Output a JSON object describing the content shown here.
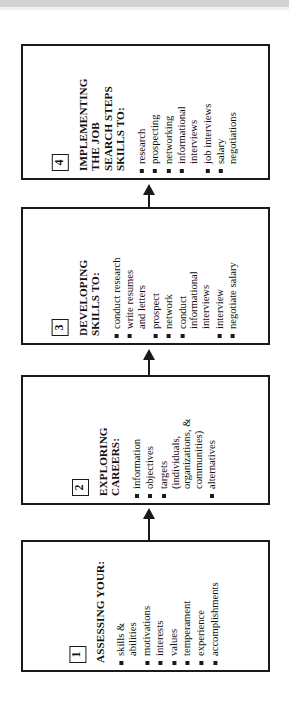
{
  "diagram": {
    "type": "flowchart",
    "orientation": "vertical-stack-rotated-90ccw",
    "flow_direction": "bottom-to-top",
    "accent_color": "#1a1a1a",
    "background_color": "#ffffff",
    "stages": [
      {
        "number": "4",
        "heading": "IMPLEMENTING\nTHE JOB\nSEARCH STEPS\nSKILLS TO:",
        "items": [
          {
            "text": "research",
            "bullet": true,
            "gap_before": false
          },
          {
            "text": "prospecting",
            "bullet": true,
            "gap_before": false
          },
          {
            "text": "networking",
            "bullet": true,
            "gap_before": false
          },
          {
            "text": "informational\ninterviews",
            "bullet": true,
            "gap_before": false
          },
          {
            "text": "job interviews",
            "bullet": true,
            "gap_before": false
          },
          {
            "text": "salary\nnegotiations",
            "bullet": true,
            "gap_before": false
          }
        ]
      },
      {
        "number": "3",
        "heading": "DEVELOPING\nSKILLS TO:",
        "items": [
          {
            "text": "conduct research",
            "bullet": true,
            "gap_before": false
          },
          {
            "text": "write resumes\nand letters",
            "bullet": true,
            "gap_before": false
          },
          {
            "text": "prospect",
            "bullet": true,
            "gap_before": false
          },
          {
            "text": "network",
            "bullet": true,
            "gap_before": false
          },
          {
            "text": "conduct\ninformational\ninterviews",
            "bullet": true,
            "gap_before": false
          },
          {
            "text": "interview",
            "bullet": true,
            "gap_before": false
          },
          {
            "text": "negotiate salary",
            "bullet": true,
            "gap_before": false
          }
        ]
      },
      {
        "number": "2",
        "heading": "EXPLORING\nCAREERS:",
        "items": [
          {
            "text": "information",
            "bullet": true,
            "gap_before": false
          },
          {
            "text": "objectives",
            "bullet": true,
            "gap_before": false
          },
          {
            "text": "targets\n(individuals,\norganizations, &\ncommunities)",
            "bullet": true,
            "gap_before": false
          },
          {
            "text": "alternatives",
            "bullet": true,
            "gap_before": false
          }
        ]
      },
      {
        "number": "1",
        "heading": "ASSESSING YOUR:",
        "items": [
          {
            "text": "skills &\nabilities",
            "bullet": true,
            "gap_before": false
          },
          {
            "text": "motivations",
            "bullet": true,
            "gap_before": false
          },
          {
            "text": "interests",
            "bullet": true,
            "gap_before": false
          },
          {
            "text": "values",
            "bullet": true,
            "gap_before": false
          },
          {
            "text": "temperament",
            "bullet": true,
            "gap_before": false
          },
          {
            "text": "experience",
            "bullet": true,
            "gap_before": false
          },
          {
            "text": "accomplishments",
            "bullet": true,
            "gap_before": false
          }
        ]
      }
    ],
    "connectors": [
      {
        "from": "1",
        "to": "2",
        "direction": "up"
      },
      {
        "from": "2",
        "to": "3",
        "direction": "up"
      },
      {
        "from": "3",
        "to": "4",
        "direction": "up"
      }
    ]
  }
}
